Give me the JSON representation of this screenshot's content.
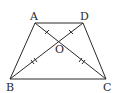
{
  "diagram": {
    "type": "geometry",
    "shape": "trapezoid",
    "vertices": {
      "A": {
        "label": "A",
        "x": 35,
        "y": 23
      },
      "D": {
        "label": "D",
        "x": 83,
        "y": 23
      },
      "B": {
        "label": "B",
        "x": 10,
        "y": 79
      },
      "C": {
        "label": "C",
        "x": 106,
        "y": 79
      }
    },
    "intersection": {
      "label": "O",
      "x": 59,
      "y": 41
    },
    "segments": [
      "AD",
      "BC",
      "AB",
      "DC",
      "AC",
      "BD"
    ],
    "tick_marks": {
      "AO": 1,
      "DO": 1,
      "BO": 2,
      "CO": 2
    },
    "stroke_color": "#2a2a2a"
  }
}
